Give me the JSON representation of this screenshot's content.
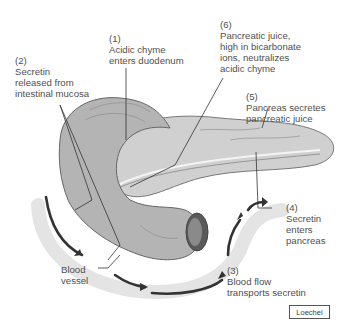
{
  "diagram": {
    "structures": [
      "duodenum",
      "pancreas",
      "pancreatic duct",
      "blood vessel"
    ],
    "labels": [
      {
        "id": "step1",
        "number": "(1)",
        "lines": [
          "Acidic chyme",
          "enters duodenum"
        ]
      },
      {
        "id": "step2",
        "number": "(2)",
        "lines": [
          "Secretin",
          "released from",
          "intestinal mucosa"
        ]
      },
      {
        "id": "step3",
        "number": "(3)",
        "lines": [
          "Blood flow",
          "transports secretin"
        ]
      },
      {
        "id": "step4",
        "number": "(4)",
        "lines": [
          "Secretin",
          "enters",
          "pancreas"
        ]
      },
      {
        "id": "step5",
        "number": "(5)",
        "lines": [
          "Pancreas secretes",
          "pancreatic juice"
        ]
      },
      {
        "id": "step6",
        "number": "(6)",
        "lines": [
          "Pancreatic juice,",
          "high in bicarbonate",
          "ions, neutralizes",
          "acidic chyme"
        ]
      },
      {
        "id": "blood-vessel",
        "number": "",
        "lines": [
          "Blood",
          "vessel"
        ]
      }
    ],
    "credit": "Loechel",
    "colors": {
      "tissue": "#b8b8b8",
      "tissue_dark": "#7a7a7a",
      "vessel": "#e6e6e6",
      "arrow": "#333333",
      "leader": "#333333"
    }
  }
}
